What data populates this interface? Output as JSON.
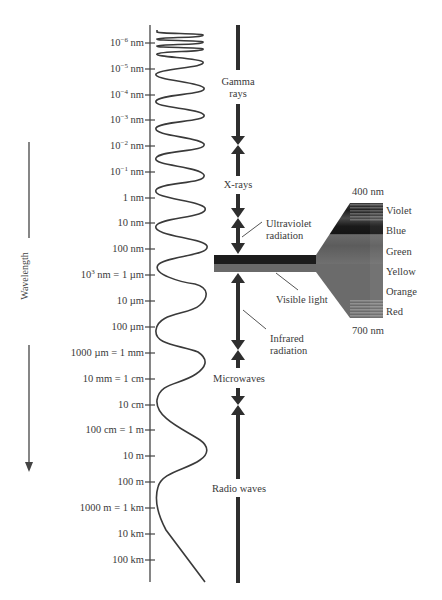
{
  "axis": {
    "label": "Wavelength",
    "ticks": [
      {
        "base": "10",
        "exp": "−6",
        "unit": " nm",
        "y": 43
      },
      {
        "base": "10",
        "exp": "−5",
        "unit": " nm",
        "y": 69
      },
      {
        "base": "10",
        "exp": "−4",
        "unit": " nm",
        "y": 95
      },
      {
        "base": "10",
        "exp": "−3",
        "unit": " nm",
        "y": 120
      },
      {
        "base": "10",
        "exp": "−2",
        "unit": " nm",
        "y": 146
      },
      {
        "base": "10",
        "exp": "−1",
        "unit": " nm",
        "y": 172
      },
      {
        "base": "1 nm",
        "exp": "",
        "unit": "",
        "y": 198
      },
      {
        "base": "10 nm",
        "exp": "",
        "unit": "",
        "y": 223
      },
      {
        "base": "100 nm",
        "exp": "",
        "unit": "",
        "y": 249
      },
      {
        "base": "10",
        "exp": "3",
        "unit": " nm = 1 µm",
        "y": 275
      },
      {
        "base": "10 µm",
        "exp": "",
        "unit": "",
        "y": 301
      },
      {
        "base": "100 µm",
        "exp": "",
        "unit": "",
        "y": 327
      },
      {
        "base": "1000 µm = 1 mm",
        "exp": "",
        "unit": "",
        "y": 353
      },
      {
        "base": "10 mm = 1 cm",
        "exp": "",
        "unit": "",
        "y": 379
      },
      {
        "base": "10 cm",
        "exp": "",
        "unit": "",
        "y": 405
      },
      {
        "base": "100 cm = 1 m",
        "exp": "",
        "unit": "",
        "y": 430
      },
      {
        "base": "10 m",
        "exp": "",
        "unit": "",
        "y": 456
      },
      {
        "base": "100 m",
        "exp": "",
        "unit": "",
        "y": 482
      },
      {
        "base": "1000 m = 1 km",
        "exp": "",
        "unit": "",
        "y": 508
      },
      {
        "base": "10 km",
        "exp": "",
        "unit": "",
        "y": 534
      },
      {
        "base": "100 km",
        "exp": "",
        "unit": "",
        "y": 560
      }
    ]
  },
  "bands": {
    "gamma": {
      "line1": "Gamma",
      "line2": "rays"
    },
    "xrays": "X-rays",
    "ultraviolet": {
      "line1": "Ultraviolet",
      "line2": "radiation"
    },
    "visible": "Visible light",
    "infrared": {
      "line1": "Infrared",
      "line2": "radiation"
    },
    "microwaves": "Microwaves",
    "radio": "Radio waves"
  },
  "visible_spectrum": {
    "top_label": "400 nm",
    "bottom_label": "700 nm",
    "colors": [
      "Violet",
      "Blue",
      "Green",
      "Yellow",
      "Orange",
      "Red"
    ]
  },
  "colors": {
    "ink": "#333333",
    "bar": "#2e2e2e",
    "band_dark": "#1a1a1a",
    "band_mid": "#555555",
    "band_light": "#777777"
  }
}
